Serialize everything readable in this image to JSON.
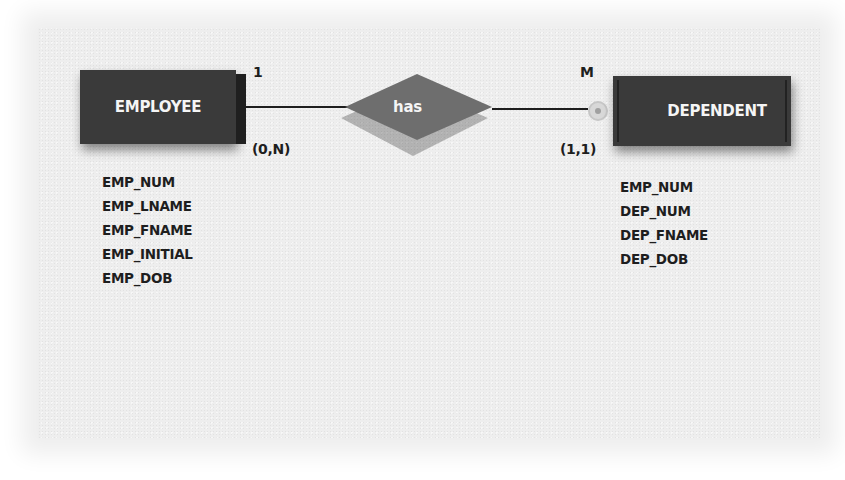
{
  "diagram": {
    "type": "ER diagram (Crow's foot / Chen-style)",
    "entities": [
      {
        "name": "EMPLOYEE",
        "attributes": [
          "EMP_NUM",
          "EMP_LNAME",
          "EMP_FNAME",
          "EMP_INITIAL",
          "EMP_DOB"
        ]
      },
      {
        "name": "DEPENDENT",
        "weak": true,
        "attributes": [
          "EMP_NUM",
          "DEP_NUM",
          "DEP_FNAME",
          "DEP_DOB"
        ]
      }
    ],
    "relationship": {
      "label": "has",
      "left_connectivity": "1",
      "left_cardinality": "(0,N)",
      "right_connectivity": "M",
      "right_cardinality": "(1,1)"
    }
  },
  "colors": {
    "entity_fill": "#3a3a3a",
    "relationship_fill": "#6e6e6e",
    "background": "#eeeeee",
    "text": "#1e1e1e"
  }
}
